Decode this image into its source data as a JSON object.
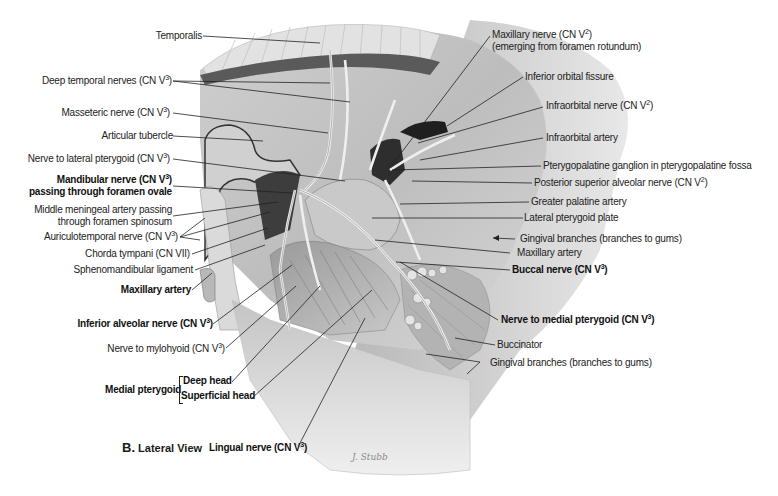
{
  "figure": {
    "caption_letter": "B.",
    "caption_text": "Lateral View",
    "artist_signature": "J. Stubb"
  },
  "labels_left": [
    {
      "id": "temporalis",
      "text": "Temporalis",
      "sup": "",
      "bold": false
    },
    {
      "id": "deep-temporal-nerves",
      "text": "Deep temporal nerves (CN V",
      "sup": "3",
      "tail": ")",
      "bold": false
    },
    {
      "id": "masseteric-nerve",
      "text": "Masseteric nerve (CN V",
      "sup": "3",
      "tail": ")",
      "bold": false
    },
    {
      "id": "articular-tubercle",
      "text": "Articular tubercle",
      "sup": "",
      "bold": false
    },
    {
      "id": "nerve-to-lateral-pterygoid",
      "text": "Nerve to lateral pterygoid (CN V",
      "sup": "3",
      "tail": ")",
      "bold": false
    },
    {
      "id": "mandibular-nerve",
      "text": "Mandibular nerve (CN V",
      "sup": "3",
      "tail": ")",
      "line2": "passing through foramen ovale",
      "bold": true
    },
    {
      "id": "middle-meningeal-artery",
      "text": "Middle meningeal artery passing",
      "line2": "through foramen spinosum",
      "bold": false
    },
    {
      "id": "auriculotemporal-nerve",
      "text": "Auriculotemporal nerve (CN V",
      "sup": "3",
      "tail": ")",
      "bold": false
    },
    {
      "id": "chorda-tympani",
      "text": "Chorda tympani (CN VII)",
      "bold": false
    },
    {
      "id": "sphenomandibular-ligament",
      "text": "Sphenomandibular ligament",
      "bold": false
    },
    {
      "id": "maxillary-artery-left",
      "text": "Maxillary artery",
      "bold": true
    },
    {
      "id": "inferior-alveolar-nerve",
      "text": "Inferior alveolar nerve (CN V",
      "sup": "3",
      "tail": ")",
      "bold": true
    },
    {
      "id": "nerve-to-mylohyoid",
      "text": "Nerve to mylohyoid (CN V",
      "sup": "3",
      "tail": ")",
      "bold": false
    },
    {
      "id": "medial-pterygoid",
      "text": "Medial pterygoid",
      "bold": true
    },
    {
      "id": "deep-head",
      "text": "Deep head",
      "bold": true
    },
    {
      "id": "superficial-head",
      "text": "Superficial head",
      "bold": true
    },
    {
      "id": "lingual-nerve",
      "text": "Lingual nerve (CN V",
      "sup": "3",
      "tail": ")",
      "bold": true
    }
  ],
  "labels_right": [
    {
      "id": "maxillary-nerve",
      "text": "Maxillary nerve (CN V",
      "sup": "2",
      "tail": ")",
      "line2": "(emerging from foramen rotundum)",
      "bold": false
    },
    {
      "id": "inferior-orbital-fissure",
      "text": "Inferior orbital fissure",
      "bold": false
    },
    {
      "id": "infraorbital-nerve",
      "text": "Infraorbital nerve (CN V",
      "sup": "2",
      "tail": ")",
      "bold": false
    },
    {
      "id": "infraorbital-artery",
      "text": "Infraorbital artery",
      "bold": false
    },
    {
      "id": "pterygopalatine-ganglion",
      "text": "Pterygopalatine ganglion in pterygopalatine fossa",
      "bold": false
    },
    {
      "id": "posterior-superior-alveolar-nerve",
      "text": "Posterior superior alveolar nerve (CN V",
      "sup": "2",
      "tail": ")",
      "bold": false
    },
    {
      "id": "greater-palatine-artery",
      "text": "Greater palatine artery",
      "bold": false
    },
    {
      "id": "lateral-pterygoid-plate",
      "text": "Lateral pterygoid plate",
      "bold": false
    },
    {
      "id": "gingival-branches-upper",
      "text": "Gingival branches (branches to gums)",
      "bold": false
    },
    {
      "id": "maxillary-artery-right",
      "text": "Maxillary artery",
      "bold": false
    },
    {
      "id": "buccal-nerve",
      "text": "Buccal nerve (CN V",
      "sup": "3",
      "tail": ")",
      "bold": true
    },
    {
      "id": "nerve-to-medial-pterygoid",
      "text": "Nerve to medial pterygoid (CN V",
      "sup": "3",
      "tail": ")",
      "bold": true
    },
    {
      "id": "buccinator",
      "text": "Buccinator",
      "bold": false
    },
    {
      "id": "gingival-branches-lower",
      "text": "Gingival branches (branches to gums)",
      "bold": false
    }
  ],
  "colors": {
    "background": "#ffffff",
    "illustration_light": "#d6d6d6",
    "illustration_mid": "#a8a8a8",
    "illustration_dark": "#4a4a4a",
    "leader_line": "#222222",
    "text": "#1a1a1a"
  }
}
